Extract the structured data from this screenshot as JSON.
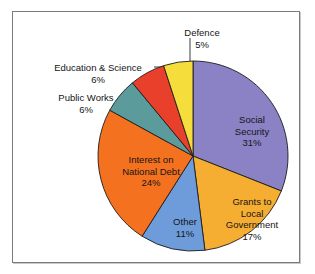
{
  "chart_data": {
    "type": "pie",
    "title": "",
    "subtitle": "",
    "xlabel": "",
    "ylabel": "",
    "legend_position": "none",
    "grid": false,
    "units": "percent",
    "start_angle_deg": 0,
    "direction": "clockwise",
    "categories": [
      "Social Security",
      "Grants to Local Government",
      "Other",
      "Interest on National Debt",
      "Public Works",
      "Education & Science",
      "Defence"
    ],
    "values": [
      31,
      17,
      11,
      24,
      6,
      6,
      5
    ],
    "colors": [
      "#8a82c4",
      "#f5ae32",
      "#6e9bd9",
      "#f4711f",
      "#5b9b9b",
      "#e8402a",
      "#f5dd3c"
    ],
    "slices": [
      {
        "name": "Social Security",
        "value": 31,
        "value_label": "31%",
        "color": "#8a82c4",
        "label_placement": "inside",
        "line1": "Social",
        "line2": "Security"
      },
      {
        "name": "Grants to Local Government",
        "value": 17,
        "value_label": "17%",
        "color": "#f5ae32",
        "label_placement": "inside",
        "line1": "Grants to",
        "line2": "Local",
        "line3": "Government"
      },
      {
        "name": "Other",
        "value": 11,
        "value_label": "11%",
        "color": "#6e9bd9",
        "label_placement": "inside",
        "line1": "Other"
      },
      {
        "name": "Interest on National Debt",
        "value": 24,
        "value_label": "24%",
        "color": "#f4711f",
        "label_placement": "inside",
        "line1": "Interest on",
        "line2": "National Debt"
      },
      {
        "name": "Public Works",
        "value": 6,
        "value_label": "6%",
        "color": "#5b9b9b",
        "label_placement": "outside-leader",
        "line1": "Public Works"
      },
      {
        "name": "Education & Science",
        "value": 6,
        "value_label": "6%",
        "color": "#e8402a",
        "label_placement": "outside-leader",
        "line1": "Education & Science"
      },
      {
        "name": "Defence",
        "value": 5,
        "value_label": "5%",
        "color": "#f5dd3c",
        "label_placement": "outside-leader",
        "line1": "Defence"
      }
    ],
    "geometry": {
      "center_x": 180,
      "center_y": 144,
      "radius": 95
    }
  },
  "frame": {
    "border_color": "#7b7b7b",
    "background": "#ffffff"
  }
}
